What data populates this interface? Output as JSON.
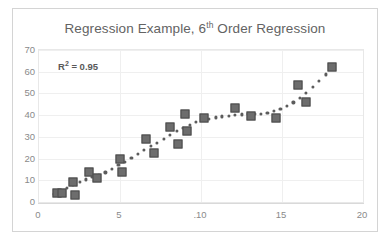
{
  "chart_data": {
    "type": "scatter",
    "title_prefix": "Regression Example, 6",
    "title_sup": "th",
    "title_suffix": " Order Regression",
    "title": "Regression Example, 6th Order Regression",
    "annotation_prefix": "R",
    "annotation_sup": "2",
    "annotation_suffix": " = 0.95",
    "annotation": "R² = 0.95",
    "r_squared": 0.95,
    "xlabel": "",
    "ylabel": "",
    "xlim": [
      0,
      20
    ],
    "ylim": [
      0,
      70
    ],
    "xticks": [
      0,
      5,
      10,
      15,
      20
    ],
    "xtick_labels": [
      "0",
      "5",
      ".10",
      "15",
      "20"
    ],
    "yticks": [
      0,
      10,
      20,
      30,
      40,
      50,
      60,
      70
    ],
    "ytick_labels": [
      "0",
      "10",
      "20",
      "30",
      "40",
      "50",
      "60",
      "70"
    ],
    "grid": true,
    "legend": false,
    "marker_color": "#6d6d6d",
    "marker_edge_color": "#4a4a4a",
    "trendline_color": "#5c5c5c",
    "trendline_style": "dotted",
    "trendline_order": 6,
    "points": [
      {
        "x": 1.1,
        "y": 4.0
      },
      {
        "x": 1.4,
        "y": 4.2
      },
      {
        "x": 2.1,
        "y": 9.0
      },
      {
        "x": 2.2,
        "y": 3.0
      },
      {
        "x": 3.1,
        "y": 14.0
      },
      {
        "x": 3.6,
        "y": 11.0
      },
      {
        "x": 5.0,
        "y": 20.0
      },
      {
        "x": 5.1,
        "y": 13.8
      },
      {
        "x": 6.6,
        "y": 29.0
      },
      {
        "x": 7.1,
        "y": 22.5
      },
      {
        "x": 8.1,
        "y": 34.5
      },
      {
        "x": 8.6,
        "y": 26.5
      },
      {
        "x": 9.0,
        "y": 40.5
      },
      {
        "x": 9.15,
        "y": 32.5
      },
      {
        "x": 10.2,
        "y": 38.5
      },
      {
        "x": 12.1,
        "y": 43.5
      },
      {
        "x": 13.1,
        "y": 39.5
      },
      {
        "x": 14.6,
        "y": 38.5
      },
      {
        "x": 16.0,
        "y": 54.0
      },
      {
        "x": 16.5,
        "y": 46.0
      },
      {
        "x": 18.1,
        "y": 62.0
      }
    ],
    "trendline": [
      {
        "x": 0.9,
        "y": 3.6
      },
      {
        "x": 1.3,
        "y": 5.0
      },
      {
        "x": 1.7,
        "y": 6.4
      },
      {
        "x": 2.1,
        "y": 7.8
      },
      {
        "x": 2.5,
        "y": 9.2
      },
      {
        "x": 2.9,
        "y": 10.4
      },
      {
        "x": 3.3,
        "y": 11.4
      },
      {
        "x": 3.7,
        "y": 12.4
      },
      {
        "x": 4.1,
        "y": 13.6
      },
      {
        "x": 4.5,
        "y": 15.2
      },
      {
        "x": 4.9,
        "y": 17.0
      },
      {
        "x": 5.3,
        "y": 18.6
      },
      {
        "x": 5.7,
        "y": 20.4
      },
      {
        "x": 6.1,
        "y": 22.2
      },
      {
        "x": 6.5,
        "y": 24.0
      },
      {
        "x": 6.9,
        "y": 25.8
      },
      {
        "x": 7.3,
        "y": 27.4
      },
      {
        "x": 7.7,
        "y": 29.2
      },
      {
        "x": 8.1,
        "y": 31.0
      },
      {
        "x": 8.5,
        "y": 32.6
      },
      {
        "x": 8.9,
        "y": 34.2
      },
      {
        "x": 9.3,
        "y": 35.6
      },
      {
        "x": 9.7,
        "y": 36.8
      },
      {
        "x": 10.1,
        "y": 37.8
      },
      {
        "x": 10.5,
        "y": 38.4
      },
      {
        "x": 10.9,
        "y": 39.0
      },
      {
        "x": 11.3,
        "y": 39.4
      },
      {
        "x": 11.7,
        "y": 39.8
      },
      {
        "x": 12.1,
        "y": 40.1
      },
      {
        "x": 12.5,
        "y": 40.3
      },
      {
        "x": 12.9,
        "y": 40.4
      },
      {
        "x": 13.3,
        "y": 40.5
      },
      {
        "x": 13.7,
        "y": 40.7
      },
      {
        "x": 14.1,
        "y": 41.2
      },
      {
        "x": 14.5,
        "y": 41.9
      },
      {
        "x": 14.9,
        "y": 42.9
      },
      {
        "x": 15.3,
        "y": 44.2
      },
      {
        "x": 15.7,
        "y": 45.9
      },
      {
        "x": 16.1,
        "y": 48.0
      },
      {
        "x": 16.5,
        "y": 50.4
      },
      {
        "x": 16.9,
        "y": 53.0
      },
      {
        "x": 17.3,
        "y": 55.8
      },
      {
        "x": 17.7,
        "y": 58.8
      },
      {
        "x": 18.1,
        "y": 61.8
      }
    ]
  }
}
